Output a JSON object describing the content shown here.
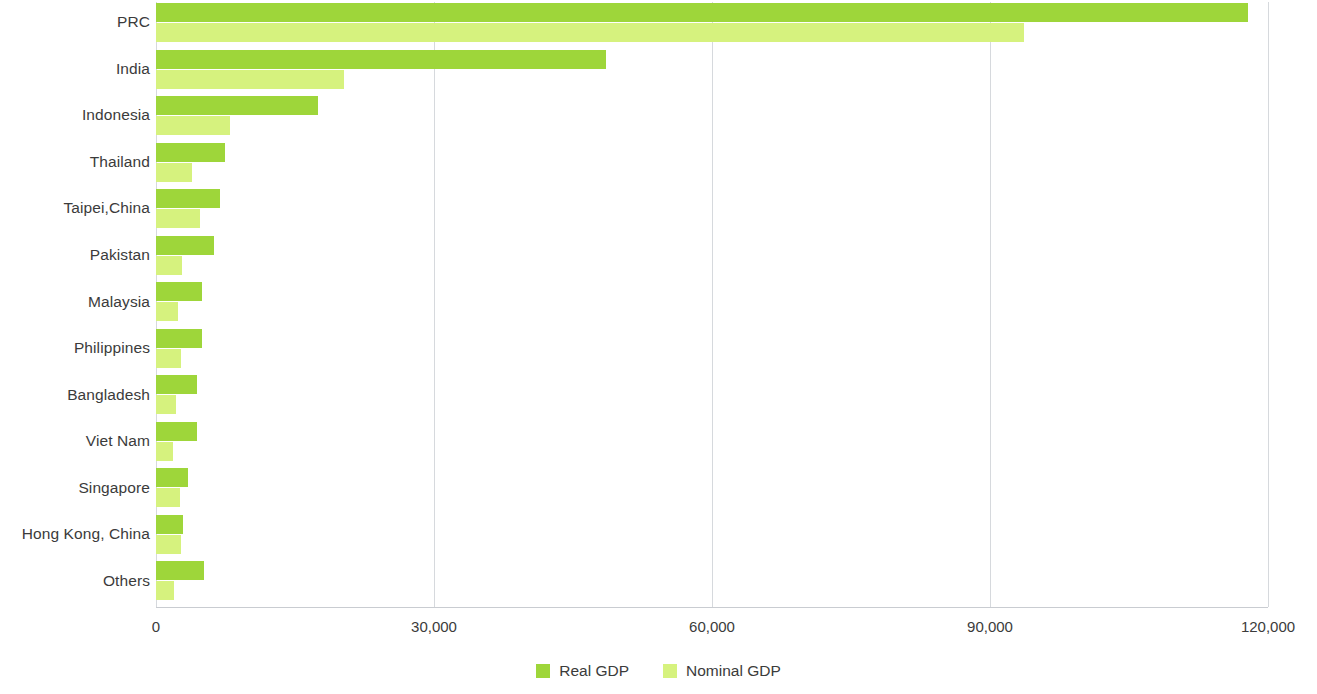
{
  "chart_data": {
    "type": "bar",
    "orientation": "horizontal",
    "title": "",
    "subtitle": "",
    "xlabel": "",
    "ylabel": "",
    "xlim": [
      0,
      120000
    ],
    "ylim": null,
    "grid": true,
    "grid_axis": "x",
    "legend_position": "bottom-center",
    "tick_labels": [
      "0",
      "30,000",
      "60,000",
      "90,000",
      "120,000"
    ],
    "tick_values": [
      0,
      30000,
      60000,
      90000,
      120000
    ],
    "categories": [
      "PRC",
      "India",
      "Indonesia",
      "Thailand",
      "Taipei,China",
      "Pakistan",
      "Malaysia",
      "Philippines",
      "Bangladesh",
      "Viet Nam",
      "Singapore",
      "Hong Kong, China",
      "Others"
    ],
    "series": [
      {
        "name": "Real GDP",
        "color": "#9ed63a",
        "values": [
          117800,
          48600,
          17500,
          7400,
          6900,
          6300,
          5000,
          5000,
          4400,
          4400,
          3500,
          2900,
          5200
        ]
      },
      {
        "name": "Nominal GDP",
        "color": "#d6f27e",
        "values": [
          93700,
          20300,
          8000,
          3900,
          4700,
          2800,
          2400,
          2700,
          2200,
          1800,
          2600,
          2700,
          1900
        ]
      }
    ]
  },
  "legend": {
    "items": [
      {
        "label": "Real GDP",
        "color": "#9ed63a"
      },
      {
        "label": "Nominal GDP",
        "color": "#d6f27e"
      }
    ]
  },
  "colors": {
    "real_gdp": "#9ed63a",
    "nominal_gdp": "#d6f27e",
    "gridline": "#d6d9dd",
    "axis": "#c9ccd1",
    "text": "#3b3b3b",
    "background": "#ffffff"
  }
}
